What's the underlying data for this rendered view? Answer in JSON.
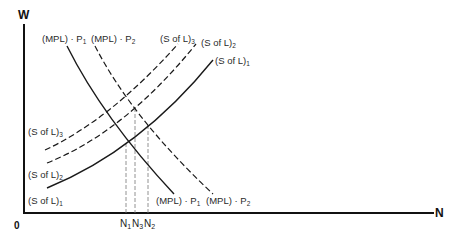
{
  "axes": {
    "y_label": "W",
    "x_label": "N",
    "origin_label": "0"
  },
  "curves": {
    "mpl_p1": {
      "base": "(MPL) · P",
      "sub": "1",
      "style": "solid"
    },
    "mpl_p2": {
      "base": "(MPL) · P",
      "sub": "2",
      "style": "dashed"
    },
    "sl1": {
      "base": "(S of L)",
      "sub": "1",
      "style": "solid"
    },
    "sl2": {
      "base": "(S of L)",
      "sub": "2",
      "style": "dashed"
    },
    "sl3": {
      "base": "(S of L)",
      "sub": "3",
      "style": "dashed"
    }
  },
  "x_ticks": [
    {
      "base": "N",
      "sub": "1"
    },
    {
      "base": "N",
      "sub": "3"
    },
    {
      "base": "N",
      "sub": "2"
    }
  ],
  "colors": {
    "line": "#1a1a1a",
    "text": "#2a2a2a",
    "background": "#ffffff"
  }
}
